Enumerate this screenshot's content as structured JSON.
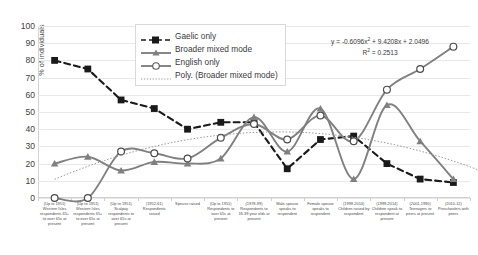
{
  "chart_data": {
    "type": "line",
    "title": "",
    "xlabel": "",
    "ylabel": "% of individuals",
    "ylim": [
      0,
      100
    ],
    "ytick_step": 10,
    "yticks": [
      0,
      10,
      20,
      30,
      40,
      50,
      60,
      70,
      80,
      90,
      100
    ],
    "grid": true,
    "legend_position": "top-center",
    "categories": [
      "(Up to 1951) Western Isles respondents 65+ to over 65s at present",
      "(Up to 1951) Western Isles respondents 65+ to over 65s at present",
      "(Up to 1951) Scalpay respondents to over 65s at present",
      "(1952-61) Respondents raised",
      "Spouse raised",
      "(Up to 1951) Respondents to over 65s at present",
      "(1978-99) Respondents to 18-39 year olds at present",
      "Male spouse speaks to respondent",
      "Female spouse speaks to respondent",
      "(1999-2014) Children raised by respondent",
      "(1999-2014) Children speak to respondent at present",
      "(2001-1990) Teenagers to peers at present",
      "(2010-12) Preschoolers with peers"
    ],
    "series": [
      {
        "name": "Gaelic only",
        "color": "#1a1a1a",
        "style": "dashed",
        "marker": "square-filled",
        "values": [
          80,
          75,
          57,
          52,
          40,
          44,
          44,
          17,
          34,
          36,
          20,
          11,
          9
        ]
      },
      {
        "name": "Broader mixed mode",
        "color": "#808080",
        "style": "solid",
        "marker": "triangle-filled",
        "values": [
          20,
          24,
          16,
          21,
          20,
          23,
          47,
          27,
          52,
          11,
          54,
          33,
          11
        ]
      },
      {
        "name": "English only",
        "color": "#808080",
        "style": "solid",
        "marker": "circle-open",
        "values": [
          0,
          0,
          27,
          26,
          23,
          35,
          43,
          34,
          48,
          33,
          63,
          75,
          88
        ]
      },
      {
        "name": "Poly. (Broader mixed mode)",
        "color": "#9a9a9a",
        "style": "dotted",
        "marker": "none",
        "trendline": true,
        "equation": "y = -0.6096x² + 9.4208x + 2.0496",
        "r_squared": "R² = 0.2513",
        "coefficients": [
          -0.6096,
          9.4208,
          2.0496
        ]
      }
    ],
    "annotations": {
      "equation_text": "y = -0.6096x",
      "equation_exponent": "2",
      "equation_rest": " + 9.4208x + 2.0496",
      "r_squared_label": "R",
      "r_squared_exponent": "2",
      "r_squared_value": " = 0.2513"
    }
  },
  "legend": {
    "items": [
      {
        "label": "Gaelic only"
      },
      {
        "label": "Broader mixed mode"
      },
      {
        "label": "English only"
      },
      {
        "label": "Poly. (Broader mixed mode)"
      }
    ]
  }
}
